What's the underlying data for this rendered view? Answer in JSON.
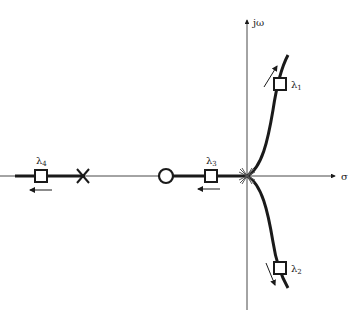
{
  "diagram": {
    "type": "root-locus",
    "axes": {
      "imag_label": "jω",
      "real_label": "σ"
    },
    "eigenvalues": [
      {
        "name": "λ",
        "sub": "1"
      },
      {
        "name": "λ",
        "sub": "2"
      },
      {
        "name": "λ",
        "sub": "3"
      },
      {
        "name": "λ",
        "sub": "4"
      }
    ],
    "markers": {
      "pole": "open-loop-pole (×)",
      "zero": "open-loop-zero (○)",
      "multiple_pole_origin": "multiple poles at origin"
    },
    "colors": {
      "ink": "#1a1a1a",
      "background": "#ffffff"
    }
  }
}
